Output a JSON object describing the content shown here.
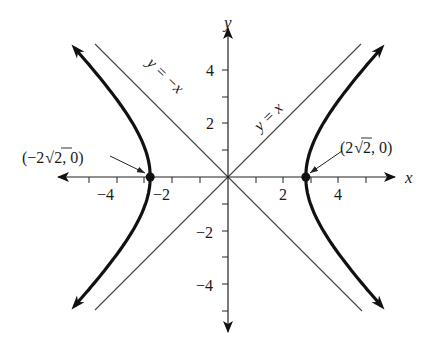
{
  "figure": {
    "type": "hyperbola-graph",
    "equation_shown": false,
    "x_axis": {
      "label": "x",
      "tick_labels": [
        "-4",
        "-2",
        "2",
        "4"
      ],
      "tick_values": [
        -5,
        -4,
        -3,
        -2,
        -1,
        1,
        2,
        3,
        4,
        5
      ],
      "range": [
        -5.5,
        5.8
      ]
    },
    "y_axis": {
      "label": "y",
      "tick_labels": [
        "4",
        "2",
        "-2",
        "-4"
      ],
      "tick_values": [
        -5,
        -4,
        -3,
        -2,
        -1,
        1,
        2,
        3,
        4
      ],
      "range": [
        -5.8,
        5.5
      ]
    },
    "asymptotes": [
      {
        "label": "y = -x",
        "slope": -1
      },
      {
        "label": "y = x",
        "slope": 1
      }
    ],
    "vertices": [
      {
        "label": "(-2√2, 0)",
        "label_prefix": "(−2",
        "label_radicand": "2",
        "label_suffix": ", 0)",
        "x": -2.828,
        "y": 0
      },
      {
        "label": "(2√2, 0)",
        "label_prefix": "(2",
        "label_radicand": "2",
        "label_suffix": ", 0)",
        "x": 2.828,
        "y": 0
      }
    ],
    "curve": {
      "description": "x^2/8 - y^2/8 = 1",
      "a_squared": 8,
      "b_squared": 8,
      "y_extent": 4.8
    },
    "colors": {
      "curve": "#111111",
      "axes": "#222222",
      "asymptote": "#444444"
    }
  },
  "text": {
    "x_label": "x",
    "y_label": "y",
    "tick_x_neg4": "−4",
    "tick_x_neg2": "−2",
    "tick_x_2": "2",
    "tick_x_4": "4",
    "tick_y_4": "4",
    "tick_y_2": "2",
    "tick_y_neg2": "−2",
    "tick_y_neg4": "−4",
    "asym_neg": "y = −x",
    "asym_pos": "y = x",
    "vertex_left_pre": "(−2",
    "vertex_left_rad": "2",
    "vertex_left_post": ", 0)",
    "vertex_right_pre": "(2",
    "vertex_right_rad": "2",
    "vertex_right_post": ", 0)"
  }
}
